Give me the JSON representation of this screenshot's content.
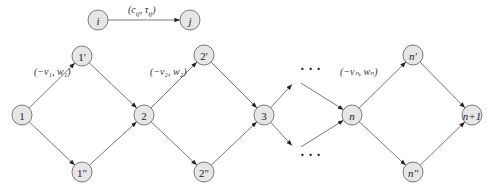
{
  "legend": {
    "from_node": "i",
    "to_node": "j",
    "edge_label": "(c_ij, τ_ij)"
  },
  "nodes": [
    {
      "id": "i",
      "label": "i",
      "italic": true
    },
    {
      "id": "j",
      "label": "j",
      "italic": true
    },
    {
      "id": "1",
      "label": "1",
      "italic": false
    },
    {
      "id": "1p",
      "label": "1'",
      "italic": false
    },
    {
      "id": "1pp",
      "label": "1\"",
      "italic": false
    },
    {
      "id": "2",
      "label": "2",
      "italic": false
    },
    {
      "id": "2p",
      "label": "2'",
      "italic": false
    },
    {
      "id": "2pp",
      "label": "2\"",
      "italic": false
    },
    {
      "id": "3",
      "label": "3",
      "italic": false
    },
    {
      "id": "n",
      "label": "n",
      "italic": true
    },
    {
      "id": "np",
      "label": "n'",
      "italic": true
    },
    {
      "id": "npp",
      "label": "n\"",
      "italic": true
    },
    {
      "id": "n1",
      "label": "n+1",
      "italic": true
    }
  ],
  "edges": [
    {
      "from": "i",
      "to": "j"
    },
    {
      "from": "1",
      "to": "1p"
    },
    {
      "from": "1",
      "to": "1pp"
    },
    {
      "from": "1p",
      "to": "2"
    },
    {
      "from": "1pp",
      "to": "2"
    },
    {
      "from": "2",
      "to": "2p"
    },
    {
      "from": "2",
      "to": "2pp"
    },
    {
      "from": "2p",
      "to": "3"
    },
    {
      "from": "2pp",
      "to": "3"
    },
    {
      "from": "3",
      "to": "dots_up"
    },
    {
      "from": "3",
      "to": "dots_down"
    },
    {
      "from": "dots_up",
      "to": "n"
    },
    {
      "from": "dots_down",
      "to": "n"
    },
    {
      "from": "n",
      "to": "np"
    },
    {
      "from": "n",
      "to": "npp"
    },
    {
      "from": "np",
      "to": "n1"
    },
    {
      "from": "npp",
      "to": "n1"
    }
  ],
  "edge_labels": [
    {
      "id": "l1",
      "text": "(−v₁, w₁)"
    },
    {
      "id": "l2",
      "text": "(−v₂, w₂)"
    },
    {
      "id": "ln",
      "text": "(−vₙ, wₙ)"
    }
  ],
  "ellipsis": "· · ·",
  "legend_label_parts": {
    "c": "c",
    "c_sub": "ij",
    "t": "τ",
    "t_sub": "ij"
  }
}
